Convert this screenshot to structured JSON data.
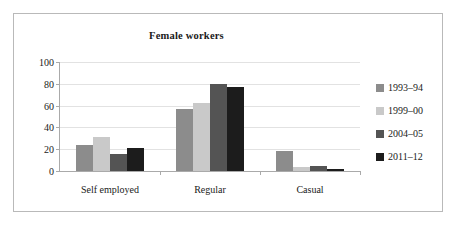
{
  "chart_data": {
    "type": "bar",
    "title": "Female workers",
    "xlabel": "",
    "ylabel": "",
    "ylim": [
      0,
      100
    ],
    "yticks": [
      0,
      20,
      40,
      60,
      80,
      100
    ],
    "grid": true,
    "legend_position": "right",
    "categories": [
      "Self employed",
      "Regular",
      "Casual"
    ],
    "series": [
      {
        "name": "1993–94",
        "color": "#8c8c8c",
        "values": [
          24,
          57,
          18
        ]
      },
      {
        "name": "1999–00",
        "color": "#c9c9c9",
        "values": [
          31,
          62,
          4
        ]
      },
      {
        "name": "2004–05",
        "color": "#545454",
        "values": [
          16,
          80,
          5
        ]
      },
      {
        "name": "2011–12",
        "color": "#1c1c1c",
        "values": [
          21,
          77,
          2
        ]
      }
    ]
  }
}
